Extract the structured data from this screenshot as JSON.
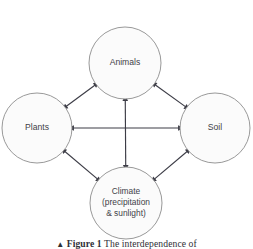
{
  "figure": {
    "background_color": "#ffffff",
    "width": 253,
    "height": 249,
    "caption": {
      "marker": "▲",
      "figure_number": "Figure 1",
      "text": "The interdependence of"
    }
  },
  "style": {
    "circle_fill": "#fbfbfb",
    "circle_stroke": "#8d8d8d",
    "arrow_color": "#3c3c46",
    "label_color": "#3f3f48"
  },
  "diagram": {
    "type": "node-link-interdependence",
    "nodes": [
      {
        "id": "animals",
        "label": "Animals",
        "lines": [
          "Animals"
        ],
        "cx": 125,
        "cy": 63,
        "r": 36
      },
      {
        "id": "plants",
        "label": "Plants",
        "lines": [
          "Plants"
        ],
        "cx": 37,
        "cy": 128,
        "r": 35
      },
      {
        "id": "soil",
        "label": "Soil",
        "lines": [
          "Soil"
        ],
        "cx": 215,
        "cy": 128,
        "r": 35
      },
      {
        "id": "climate",
        "label": "Climate (precipitation & sunlight)",
        "lines": [
          "Climate",
          "(precipitation",
          "& sunlight)"
        ],
        "cx": 126,
        "cy": 203,
        "r": 36
      }
    ],
    "edges": [
      {
        "id": "plants-animals",
        "from": "plants",
        "to": "animals",
        "direction": "both"
      },
      {
        "id": "animals-soil",
        "from": "animals",
        "to": "soil",
        "direction": "both"
      },
      {
        "id": "plants-climate",
        "from": "plants",
        "to": "climate",
        "direction": "both"
      },
      {
        "id": "climate-soil",
        "from": "climate",
        "to": "soil",
        "direction": "both"
      },
      {
        "id": "plants-soil",
        "from": "plants",
        "to": "soil",
        "direction": "both"
      },
      {
        "id": "animals-climate",
        "from": "animals",
        "to": "climate",
        "direction": "both"
      }
    ]
  }
}
